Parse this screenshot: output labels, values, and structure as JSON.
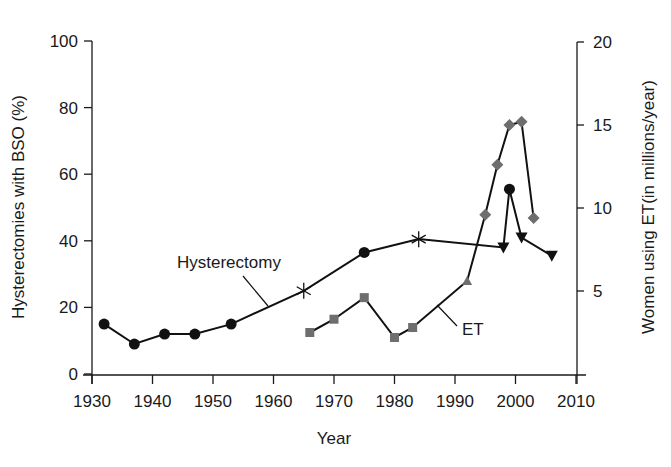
{
  "chart_data": {
    "type": "line",
    "title": "",
    "xlabel": "Year",
    "ylabel_left": "Hysterectomies with BSO (%)",
    "ylabel_right": "Women using ET(in millions/year)",
    "xlim": [
      1930,
      2010
    ],
    "ylim_left": [
      0,
      100
    ],
    "ylim_right": [
      0,
      20
    ],
    "x_ticks": [
      1930,
      1940,
      1950,
      1960,
      1970,
      1980,
      1990,
      2000,
      2010
    ],
    "y_ticks_left": [
      0,
      20,
      40,
      60,
      80,
      100
    ],
    "y_ticks_right": [
      5,
      10,
      15,
      20
    ],
    "grid": false,
    "legend": "inline labels",
    "series": [
      {
        "name": "Hysterectomy",
        "axis": "left",
        "label": "Hysterectomy",
        "points": [
          {
            "x": 1932,
            "y": 15,
            "marker": "circle"
          },
          {
            "x": 1937,
            "y": 9,
            "marker": "circle"
          },
          {
            "x": 1942,
            "y": 12,
            "marker": "circle"
          },
          {
            "x": 1947,
            "y": 12,
            "marker": "circle"
          },
          {
            "x": 1953,
            "y": 15,
            "marker": "circle"
          },
          {
            "x": 1965,
            "y": 25,
            "marker": "asterisk"
          },
          {
            "x": 1975,
            "y": 36.5,
            "marker": "circle"
          },
          {
            "x": 1984,
            "y": 40.5,
            "marker": "asterisk"
          },
          {
            "x": 1998,
            "y": 38,
            "marker": "triangle-down"
          },
          {
            "x": 1999,
            "y": 55.5,
            "marker": "circle"
          },
          {
            "x": 2001,
            "y": 41,
            "marker": "triangle-down"
          },
          {
            "x": 2006,
            "y": 35.5,
            "marker": "triangle-down"
          }
        ]
      },
      {
        "name": "ET",
        "axis": "right",
        "label": "ET",
        "points": [
          {
            "x": 1966,
            "y": 2.5,
            "marker": "square"
          },
          {
            "x": 1970,
            "y": 3.3,
            "marker": "square"
          },
          {
            "x": 1975,
            "y": 4.6,
            "marker": "square"
          },
          {
            "x": 1980,
            "y": 2.2,
            "marker": "square"
          },
          {
            "x": 1983,
            "y": 2.8,
            "marker": "square"
          },
          {
            "x": 1992,
            "y": 5.6,
            "marker": "triangle-up"
          },
          {
            "x": 1995,
            "y": 9.6,
            "marker": "diamond"
          },
          {
            "x": 1997,
            "y": 12.6,
            "marker": "diamond"
          },
          {
            "x": 1999,
            "y": 15.0,
            "marker": "diamond"
          },
          {
            "x": 2001,
            "y": 15.2,
            "marker": "diamond"
          },
          {
            "x": 2003,
            "y": 9.4,
            "marker": "diamond"
          }
        ]
      }
    ]
  },
  "colors": {
    "axis": "#1a1a1a",
    "hysterectomy_marker": "#111111",
    "et_marker": "#6e6e6e",
    "line": "#111111"
  },
  "labels": {
    "hysterectomy_label": "Hysterectomy",
    "et_label": "ET",
    "x_axis_title": "Year",
    "y_left_title": "Hysterectomies with BSO (%)",
    "y_right_title": "Women using ET(in millions/year)"
  }
}
